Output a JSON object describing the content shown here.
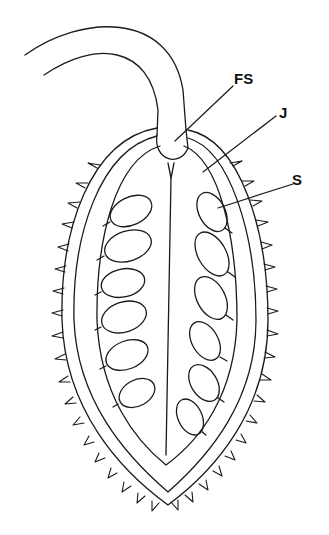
{
  "diagram": {
    "type": "botanical longitudinal section",
    "labels": [
      {
        "id": "FS",
        "text": "FS",
        "x": 234,
        "y": 70
      },
      {
        "id": "J",
        "text": "J",
        "x": 279,
        "y": 104
      },
      {
        "id": "S",
        "text": "S",
        "x": 292,
        "y": 172
      }
    ],
    "seed_count_left": 6,
    "seed_count_right": 6,
    "colors": {
      "line": "#1a1a1a",
      "background": "#ffffff"
    }
  }
}
